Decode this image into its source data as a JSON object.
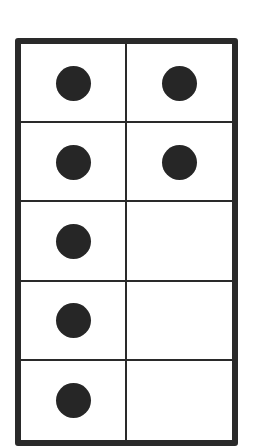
{
  "diagram": {
    "type": "ten-frame",
    "rows": 5,
    "columns": 2,
    "filled_count": 7,
    "cells": [
      {
        "row": 1,
        "col": 1,
        "filled": true
      },
      {
        "row": 1,
        "col": 2,
        "filled": true
      },
      {
        "row": 2,
        "col": 1,
        "filled": true
      },
      {
        "row": 2,
        "col": 2,
        "filled": true
      },
      {
        "row": 3,
        "col": 1,
        "filled": true
      },
      {
        "row": 3,
        "col": 2,
        "filled": false
      },
      {
        "row": 4,
        "col": 1,
        "filled": true
      },
      {
        "row": 4,
        "col": 2,
        "filled": false
      },
      {
        "row": 5,
        "col": 1,
        "filled": true
      },
      {
        "row": 5,
        "col": 2,
        "filled": false
      }
    ],
    "colors": {
      "line": "#2a2a2a",
      "dot": "#262626",
      "background": "#ffffff"
    }
  }
}
